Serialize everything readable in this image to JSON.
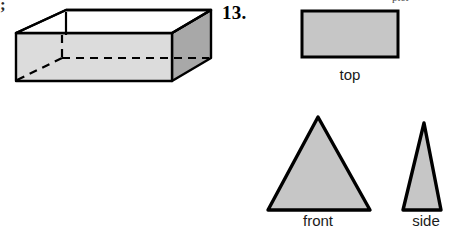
{
  "page": {
    "width": 471,
    "height": 240,
    "background": "#ffffff"
  },
  "fragments": {
    "left_margin_glyph": ";",
    "top_right_cutoff": "pict"
  },
  "problem": {
    "number_label": "13."
  },
  "colors": {
    "outline": "#000000",
    "fill_light": "#dcdcdc",
    "fill_mid": "#c6c6c6",
    "fill_dark": "#a8a8a8",
    "text": "#1a1a1a",
    "background": "#ffffff"
  },
  "box_figure": {
    "name": "open-rectangular-prism",
    "description": "Open-top rectangular box drawn in oblique projection with dashed hidden edges",
    "faces": [
      {
        "name": "front-face",
        "fill": "#dcdcdc"
      },
      {
        "name": "right-face",
        "fill": "#a8a8a8"
      },
      {
        "name": "inner-top-opening",
        "fill": "#ffffff"
      }
    ],
    "hidden_edges": {
      "style": "dashed",
      "count": 3
    },
    "visible_vertices": {
      "front_top_left": [
        12,
        31
      ],
      "front_top_right": [
        168,
        31
      ],
      "front_bottom_left": [
        12,
        79
      ],
      "front_bottom_right": [
        168,
        79
      ],
      "back_top_left": [
        62,
        8
      ],
      "back_top_right": [
        207,
        8
      ],
      "back_bottom_right": [
        207,
        56
      ]
    }
  },
  "views": {
    "top": {
      "label": "top",
      "shape": "rectangle",
      "fill": "#c6c6c6",
      "bounds": {
        "x": 302,
        "y": 11,
        "width": 96,
        "height": 46
      }
    },
    "front": {
      "label": "front",
      "shape": "triangle",
      "fill": "#c6c6c6",
      "apex": [
        318,
        117
      ],
      "base_left": [
        268,
        210
      ],
      "base_right": [
        370,
        210
      ]
    },
    "side": {
      "label": "side",
      "shape": "triangle",
      "fill": "#c6c6c6",
      "apex": [
        424,
        123
      ],
      "base_left": [
        403,
        210
      ],
      "base_right": [
        441,
        210
      ]
    }
  }
}
